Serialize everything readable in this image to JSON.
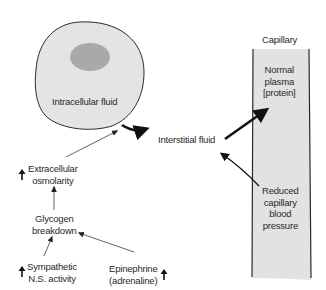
{
  "diagram": {
    "nodes": {
      "intracellular": {
        "label": "Intracellular fluid"
      },
      "interstitial": {
        "label": "Interstitial fluid"
      },
      "capillary_title": {
        "label": "Capillary"
      },
      "normal_plasma": {
        "label": "Normal\nplasma\n[protein]"
      },
      "reduced_pressure": {
        "label": "Reduced\ncapillary\nblood\npressure"
      },
      "extracellular_osmolarity": {
        "label": "Extracellular\nosmolarity",
        "indicator": "increase"
      },
      "glycogen_breakdown": {
        "label": "Glycogen\nbreakdown"
      },
      "sympathetic": {
        "label": "Sympathetic\nN.S. activity",
        "indicator": "increase"
      },
      "epinephrine": {
        "label": "Epinephrine\n(adrenaline)",
        "indicator": "increase"
      }
    },
    "edges": [
      {
        "from": "intracellular",
        "to": "interstitial",
        "style": "thick"
      },
      {
        "from": "interstitial",
        "to": "normal_plasma",
        "style": "thick"
      },
      {
        "from": "reduced_pressure",
        "to": "interstitial",
        "style": "medium"
      },
      {
        "from": "extracellular_osmolarity",
        "to": "intracellular",
        "style": "thin"
      },
      {
        "from": "glycogen_breakdown",
        "to": "extracellular_osmolarity",
        "style": "thin"
      },
      {
        "from": "sympathetic",
        "to": "glycogen_breakdown",
        "style": "thin"
      },
      {
        "from": "epinephrine",
        "to": "glycogen_breakdown",
        "style": "thin"
      }
    ],
    "colors": {
      "cell_fill": "#e4e4e4",
      "nucleus_fill": "#a9a9a9",
      "capillary_fill": "#e2e2e2",
      "outline": "#2a2a2a",
      "arrow": "#111111",
      "text": "#2a2a2a"
    }
  }
}
